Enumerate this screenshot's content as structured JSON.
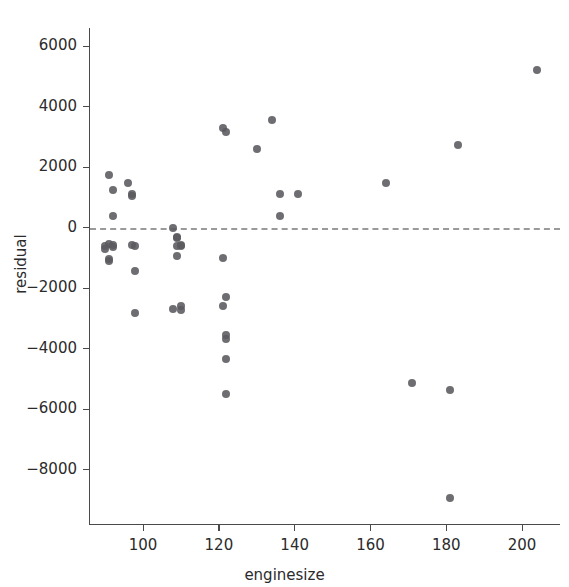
{
  "chart_data": {
    "type": "scatter",
    "title": "",
    "xlabel": "enginesize",
    "ylabel": "residual",
    "xlim": [
      86,
      210
    ],
    "ylim": [
      -9800,
      6600
    ],
    "xticks": [
      100,
      120,
      140,
      160,
      180,
      200
    ],
    "xtick_labels": [
      "100",
      "120",
      "140",
      "160",
      "180",
      "200"
    ],
    "yticks": [
      6000,
      4000,
      2000,
      0,
      -2000,
      -4000,
      -6000,
      -8000
    ],
    "ytick_labels": [
      "6000",
      "4000",
      "2000",
      "0",
      "−2000",
      "−4000",
      "−6000",
      "−8000"
    ],
    "grid": false,
    "legend": null,
    "reference_line": {
      "orientation": "horizontal",
      "y": 0,
      "style": "dashed",
      "color": "#9a9a9a"
    },
    "marker": {
      "shape": "circle",
      "color": "#5a5a5e",
      "size": 8,
      "alpha": 0.88
    },
    "x": [
      91,
      92,
      92,
      91,
      90,
      90,
      91,
      91,
      92,
      92,
      97,
      97,
      97,
      98,
      98,
      98,
      96,
      108,
      109,
      109,
      109,
      110,
      110,
      109,
      110,
      108,
      110,
      121,
      121,
      122,
      122,
      122,
      122,
      122,
      122,
      121,
      130,
      134,
      136,
      136,
      141,
      164,
      171,
      181,
      183,
      181,
      204
    ],
    "y": [
      1750,
      1240,
      400,
      -530,
      -600,
      -700,
      -1030,
      -1120,
      -590,
      -640,
      1100,
      1060,
      -580,
      -620,
      -1450,
      -2820,
      1490,
      0,
      -320,
      -360,
      -600,
      -620,
      -560,
      -930,
      -2600,
      -2700,
      -2720,
      -1000,
      3300,
      3150,
      -2300,
      -3550,
      -3680,
      -4330,
      -5500,
      -2600,
      2600,
      3550,
      380,
      1100,
      1100,
      1470,
      -5130,
      -5380,
      2720,
      -8940,
      5220
    ],
    "n_points": 47
  },
  "axes": {
    "x_tick_px": {
      "100": 158,
      "120": 231,
      "140": 305,
      "160": 378,
      "180": 452,
      "200": 525
    },
    "y_tick_px": {
      "6000": 30,
      "4000": 94,
      "2000": 158,
      "0": 222,
      "-2000": 286,
      "-4000": 350,
      "-6000": 414,
      "-8000": 478
    }
  }
}
